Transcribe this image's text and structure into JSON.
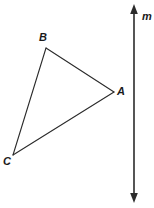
{
  "figure": {
    "background_color": "#ffffff",
    "stroke_color": "#2b2b2b",
    "stroke_width": 1,
    "width": 154,
    "height": 208
  },
  "triangle": {
    "name": "triangle-ABC",
    "vertices": [
      {
        "label": "A",
        "x": 114,
        "y": 92
      },
      {
        "label": "B",
        "x": 46,
        "y": 48
      },
      {
        "label": "C",
        "x": 13,
        "y": 155
      }
    ],
    "edges": [
      {
        "from": "B",
        "to": "A"
      },
      {
        "from": "A",
        "to": "C"
      },
      {
        "from": "C",
        "to": "B"
      }
    ]
  },
  "line": {
    "label": "m",
    "orientation": "vertical",
    "x": 134,
    "y_top": 6,
    "y_bottom": 201,
    "arrowheads": "both"
  },
  "labels": {
    "A": "A",
    "B": "B",
    "C": "C",
    "m": "m"
  }
}
